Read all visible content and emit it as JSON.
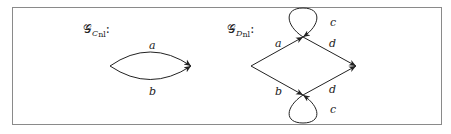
{
  "left_graph": {
    "title": "𝒢",
    "subscript_main": "C",
    "subscript_sub": "nl",
    "suffix": ":",
    "edges": [
      {
        "label": "a",
        "from": "source",
        "to": "target",
        "curve": "upper"
      },
      {
        "label": "b",
        "from": "source",
        "to": "target",
        "curve": "lower"
      }
    ]
  },
  "right_graph": {
    "title": "𝒢",
    "subscript_main": "D",
    "subscript_sub": "nl",
    "suffix": ":",
    "edges": [
      {
        "label": "a",
        "from": "left",
        "to": "top"
      },
      {
        "label": "c",
        "from": "top",
        "to": "top",
        "kind": "loop"
      },
      {
        "label": "d",
        "from": "top",
        "to": "right"
      },
      {
        "label": "b",
        "from": "left",
        "to": "bottom"
      },
      {
        "label": "c",
        "from": "bottom",
        "to": "bottom",
        "kind": "loop"
      },
      {
        "label": "d",
        "from": "bottom",
        "to": "right"
      }
    ]
  },
  "colors": {
    "stroke": "#222222",
    "frame": "#8a8a8a"
  }
}
